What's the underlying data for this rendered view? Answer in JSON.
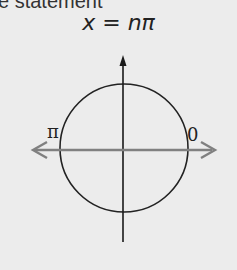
{
  "header": {
    "cut_text": "e statement"
  },
  "equation": {
    "lhs": "x",
    "op": "=",
    "rhs": "nπ"
  },
  "diagram": {
    "labels": {
      "left": "π",
      "right": "0"
    },
    "colors": {
      "circle": "#222222",
      "axis_vertical": "#1a1a1a",
      "axis_horizontal": "#808080",
      "background": "#ececec"
    }
  }
}
